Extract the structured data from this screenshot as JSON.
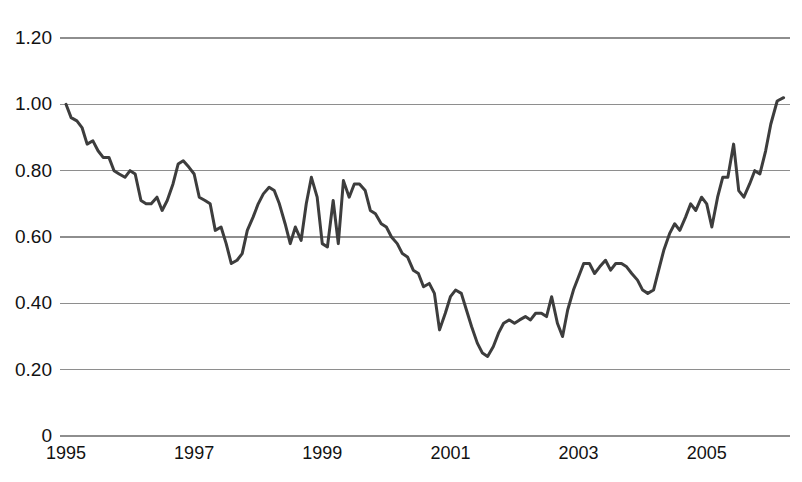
{
  "chart_data": {
    "type": "line",
    "title": "",
    "subtitle": "",
    "xlabel": "",
    "ylabel": "",
    "grid": true,
    "legend": "none",
    "xlim": [
      1995.0,
      2006.3
    ],
    "ylim": [
      0,
      1.3
    ],
    "y_ticks": [
      0,
      0.2,
      0.4,
      0.6,
      0.8,
      1.0,
      1.2
    ],
    "y_tick_labels": [
      "0",
      "0.20",
      "0.40",
      "0.60",
      "0.80",
      "1.00",
      "1.20"
    ],
    "x_ticks": [
      1995,
      1997,
      1999,
      2001,
      2003,
      2005
    ],
    "x_tick_labels": [
      "1995",
      "1997",
      "1999",
      "2001",
      "2003",
      "2005"
    ],
    "line_color": "#3d3d3d",
    "grid_color": "#8e8e8e",
    "background_color": "#ffffff",
    "series": [
      {
        "name": "series-1",
        "x": [
          1995.0,
          1995.08,
          1995.17,
          1995.25,
          1995.33,
          1995.42,
          1995.5,
          1995.58,
          1995.67,
          1995.75,
          1995.83,
          1995.92,
          1996.0,
          1996.08,
          1996.17,
          1996.25,
          1996.33,
          1996.42,
          1996.5,
          1996.58,
          1996.67,
          1996.75,
          1996.83,
          1996.92,
          1997.0,
          1997.08,
          1997.17,
          1997.25,
          1997.33,
          1997.42,
          1997.5,
          1997.58,
          1997.67,
          1997.75,
          1997.83,
          1997.92,
          1998.0,
          1998.08,
          1998.17,
          1998.25,
          1998.33,
          1998.42,
          1998.5,
          1998.58,
          1998.67,
          1998.75,
          1998.83,
          1998.92,
          1999.0,
          1999.08,
          1999.17,
          1999.25,
          1999.33,
          1999.42,
          1999.5,
          1999.58,
          1999.67,
          1999.75,
          1999.83,
          1999.92,
          2000.0,
          2000.08,
          2000.17,
          2000.25,
          2000.33,
          2000.42,
          2000.5,
          2000.58,
          2000.67,
          2000.75,
          2000.83,
          2000.92,
          2001.0,
          2001.08,
          2001.17,
          2001.25,
          2001.33,
          2001.42,
          2001.5,
          2001.58,
          2001.67,
          2001.75,
          2001.83,
          2001.92,
          2002.0,
          2002.08,
          2002.17,
          2002.25,
          2002.33,
          2002.42,
          2002.5,
          2002.58,
          2002.67,
          2002.75,
          2002.83,
          2002.92,
          2003.0,
          2003.08,
          2003.17,
          2003.25,
          2003.33,
          2003.42,
          2003.5,
          2003.58,
          2003.67,
          2003.75,
          2003.83,
          2003.92,
          2004.0,
          2004.08,
          2004.17,
          2004.25,
          2004.33,
          2004.42,
          2004.5,
          2004.58,
          2004.67,
          2004.75,
          2004.83,
          2004.92,
          2005.0,
          2005.08,
          2005.17,
          2005.25,
          2005.33,
          2005.42,
          2005.5,
          2005.58,
          2005.67,
          2005.75,
          2005.83,
          2005.92,
          2006.0,
          2006.1,
          2006.2
        ],
        "y": [
          1.0,
          0.96,
          0.95,
          0.93,
          0.88,
          0.89,
          0.86,
          0.84,
          0.84,
          0.8,
          0.79,
          0.78,
          0.8,
          0.79,
          0.71,
          0.7,
          0.7,
          0.72,
          0.68,
          0.71,
          0.76,
          0.82,
          0.83,
          0.81,
          0.79,
          0.72,
          0.71,
          0.7,
          0.62,
          0.63,
          0.58,
          0.52,
          0.53,
          0.55,
          0.62,
          0.66,
          0.7,
          0.73,
          0.75,
          0.74,
          0.7,
          0.64,
          0.58,
          0.63,
          0.59,
          0.7,
          0.78,
          0.72,
          0.58,
          0.57,
          0.71,
          0.58,
          0.77,
          0.72,
          0.76,
          0.76,
          0.74,
          0.68,
          0.67,
          0.64,
          0.63,
          0.6,
          0.58,
          0.55,
          0.54,
          0.5,
          0.49,
          0.45,
          0.46,
          0.43,
          0.32,
          0.37,
          0.42,
          0.44,
          0.43,
          0.38,
          0.33,
          0.28,
          0.25,
          0.24,
          0.27,
          0.31,
          0.34,
          0.35,
          0.34,
          0.35,
          0.36,
          0.35,
          0.37,
          0.37,
          0.36,
          0.42,
          0.34,
          0.3,
          0.38,
          0.44,
          0.48,
          0.52,
          0.52,
          0.49,
          0.51,
          0.53,
          0.5,
          0.52,
          0.52,
          0.51,
          0.49,
          0.47,
          0.44,
          0.43,
          0.44,
          0.5,
          0.56,
          0.61,
          0.64,
          0.62,
          0.66,
          0.7,
          0.68,
          0.72,
          0.7,
          0.63,
          0.72,
          0.78,
          0.78,
          0.88,
          0.74,
          0.72,
          0.76,
          0.8,
          0.79,
          0.86,
          0.94,
          1.01,
          1.02
        ]
      }
    ],
    "notable_points": {
      "start_1995": 1.0,
      "peak_1996": 0.83,
      "trough_1997": 0.52,
      "peak_1999": 0.77,
      "trough_2001": 0.24,
      "plateau_2002_2003": 0.52,
      "peak_2006": 1.26,
      "end_2006": 1.24
    }
  },
  "caption": {
    "text": ""
  }
}
